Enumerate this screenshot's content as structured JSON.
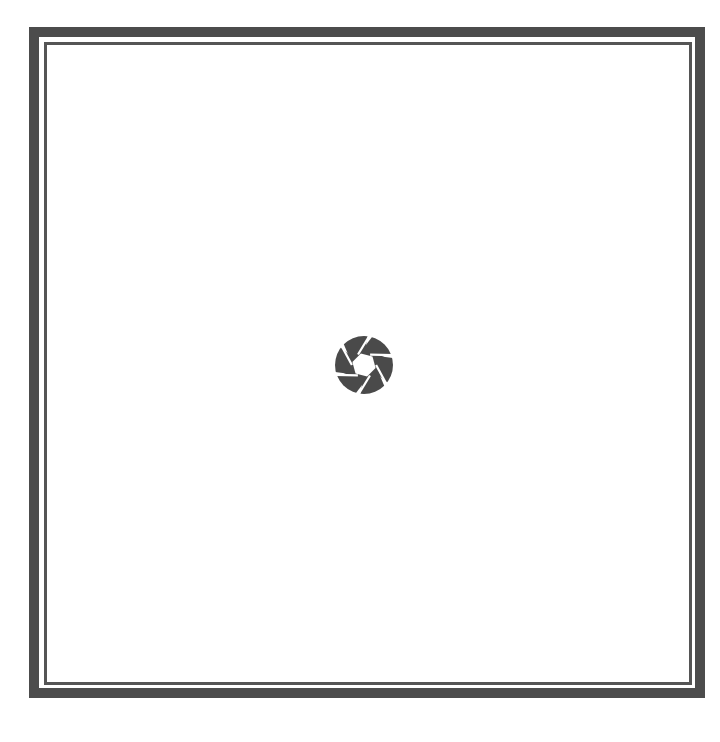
{
  "screen": {
    "state": "loading",
    "background_color": "#ffffff"
  },
  "frame": {
    "outer_border_color": "#4c4c4c",
    "inner_border_color": "#555555"
  },
  "loader": {
    "icon": "camera-aperture-icon",
    "color": "#4a4a4a",
    "blades": 6
  }
}
